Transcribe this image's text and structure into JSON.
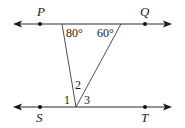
{
  "diagram": {
    "type": "geometry",
    "lines": [
      {
        "id": "line-PQ",
        "name": "PQ",
        "y": 24,
        "x_start": 13,
        "x_end": 172
      },
      {
        "id": "line-ST",
        "name": "ST",
        "y": 107,
        "x_start": 13,
        "x_end": 172
      }
    ],
    "points": [
      {
        "id": "P",
        "label": "P",
        "x": 40,
        "y": 24,
        "label_x": 41,
        "label_y": 15
      },
      {
        "id": "Q",
        "label": "Q",
        "x": 145,
        "y": 24,
        "label_x": 145,
        "label_y": 15
      },
      {
        "id": "S",
        "label": "S",
        "x": 40,
        "y": 107,
        "label_x": 40,
        "label_y": 121
      },
      {
        "id": "T",
        "label": "T",
        "x": 145,
        "y": 107,
        "label_x": 145,
        "label_y": 121
      }
    ],
    "triangle": {
      "top_left": {
        "x": 62,
        "y": 24
      },
      "top_right": {
        "x": 121,
        "y": 24
      },
      "bottom": {
        "x": 76,
        "y": 107
      }
    },
    "angle_labels": [
      {
        "id": "angle-80",
        "label": "80°",
        "x": 67,
        "y": 37
      },
      {
        "id": "angle-60",
        "label": "60°",
        "x": 97,
        "y": 37
      },
      {
        "id": "angle-1",
        "label": "1",
        "x": 65,
        "y": 104
      },
      {
        "id": "angle-2",
        "label": "2",
        "x": 76,
        "y": 88
      },
      {
        "id": "angle-3",
        "label": "3",
        "x": 84,
        "y": 104
      }
    ],
    "colors": {
      "line": "#2a2a2a",
      "background": "#ffffff"
    }
  }
}
